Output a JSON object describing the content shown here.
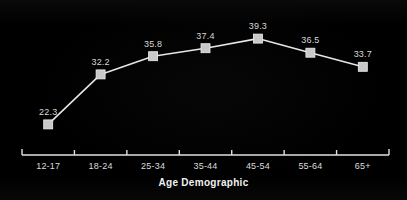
{
  "chart_data": {
    "type": "line",
    "title": "",
    "subtitle": "",
    "xlabel": "Age Demographic",
    "ylabel": "",
    "categories": [
      "12-17",
      "18-24",
      "25-34",
      "35-44",
      "45-54",
      "55-64",
      "65+"
    ],
    "values": [
      22.3,
      32.2,
      35.8,
      37.4,
      39.3,
      36.5,
      33.7
    ],
    "data_labels": [
      "22.3",
      "32.2",
      "35.8",
      "37.4",
      "39.3",
      "36.5",
      "33.7"
    ],
    "series": [
      {
        "name": "",
        "values": [
          22.3,
          32.2,
          35.8,
          37.4,
          39.3,
          36.5,
          33.7
        ]
      }
    ],
    "ylim": [
      20.0,
      41.0
    ],
    "grid": false,
    "legend": false,
    "legend_position": "none",
    "marker": "square",
    "colors": {
      "background": "#030303",
      "line": "#e6e6e6",
      "marker_fill": "#c9c9c9",
      "marker_edge": "#efefef",
      "text": "#dcdcdc",
      "axis": "#e0e0e0"
    }
  },
  "axis": {
    "title": "Age Demographic",
    "tick_labels": [
      "12-17",
      "18-24",
      "25-34",
      "35-44",
      "45-54",
      "55-64",
      "65+"
    ]
  }
}
